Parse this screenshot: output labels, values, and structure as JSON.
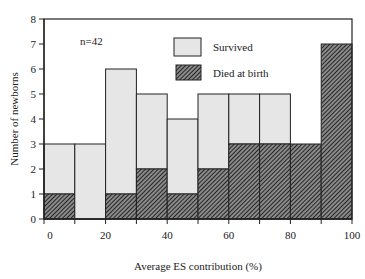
{
  "chart_data": {
    "type": "bar",
    "stacked": true,
    "title": "",
    "xlabel": "Average ES contribution (%)",
    "ylabel": "Number of newborns",
    "xlim": [
      0,
      100
    ],
    "ylim": [
      0,
      8
    ],
    "bin_edges": [
      0,
      10,
      20,
      30,
      40,
      50,
      60,
      70,
      80,
      90,
      100
    ],
    "categories": [
      "0-10",
      "10-20",
      "20-30",
      "30-40",
      "40-50",
      "50-60",
      "60-70",
      "70-80",
      "80-90",
      "90-100"
    ],
    "series": [
      {
        "name": "Died at birth",
        "values": [
          1,
          0,
          1,
          2,
          1,
          2,
          3,
          3,
          3,
          7
        ],
        "fill": "hatched",
        "color": "#3a3a3a"
      },
      {
        "name": "Survived",
        "values": [
          2,
          3,
          5,
          3,
          3,
          3,
          2,
          2,
          0,
          0
        ],
        "fill": "solid",
        "color": "#e6e6e6"
      }
    ],
    "totals": [
      3,
      3,
      6,
      5,
      4,
      5,
      5,
      5,
      3,
      7
    ],
    "x_ticks": [
      0,
      20,
      40,
      60,
      80,
      100
    ],
    "y_ticks": [
      0,
      1,
      2,
      3,
      4,
      5,
      6,
      7,
      8
    ],
    "annotations": [
      "n=42"
    ],
    "legend": {
      "position": "upper-center-right",
      "entries": [
        "Survived",
        "Died at birth"
      ]
    },
    "grid": false
  },
  "labels": {
    "xlabel": "Average ES contribution (%)",
    "ylabel": "Number of newborns",
    "annotation": "n=42",
    "legend_survived": "Survived",
    "legend_died": "Died at birth"
  }
}
